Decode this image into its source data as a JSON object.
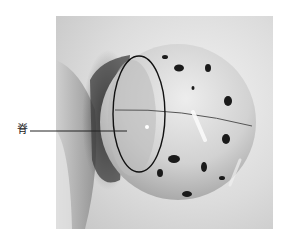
{
  "figure": {
    "annotation_label": "脊",
    "annotation_shape": "ellipse",
    "colors": {
      "background": "#ffffff",
      "photo_bg_light": "#e8e8e8",
      "shell": "#d4d4d4",
      "spots": "#1a1a1a",
      "shadow": "#3a3a3a",
      "annotation_stroke": "#111111"
    }
  }
}
